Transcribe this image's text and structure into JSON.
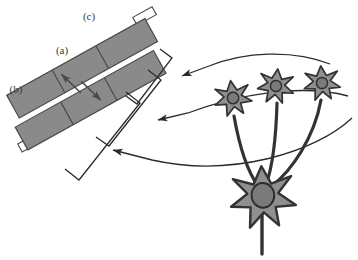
{
  "figure": {
    "background_color": "#ffffff",
    "labels": [
      {
        "id": "a",
        "text": "(a)",
        "x": 62,
        "y": 54,
        "refers_to": "bidirectional-transport-arrows"
      },
      {
        "id": "b",
        "text": "(b)",
        "x": 16,
        "y": 93,
        "refers_to": "lower-myelin-band"
      },
      {
        "id": "c",
        "text": "(c)",
        "x": 89,
        "y": 20,
        "refers_to": "upper-myelin-band"
      }
    ],
    "colors": {
      "band_fill": "#8a8a8a",
      "band_stroke": "#4a4a4a",
      "soma_fill": "#8f8f8f",
      "soma_stroke": "#333333",
      "nucleus_fill": "#7a7a7a",
      "nucleus_stroke": "#2e2e2e",
      "line_stroke": "#2b2b2b",
      "label_color": "#3a3a3a",
      "tab_fill": "#ffffff"
    },
    "bands": {
      "count": 2,
      "description": "Two parallel gray bands oriented diagonally, separated by a thin white cleft",
      "segment_divider_count": 4,
      "end_tabs": 2
    },
    "arrows": {
      "transport": [
        {
          "name": "arrow-up-left",
          "direction": "up-left"
        },
        {
          "name": "arrow-down-right",
          "direction": "down-right"
        }
      ],
      "pointer_count": 3,
      "pointer_description": "Three curved arrows leading from the glial cells to three nested brackets"
    },
    "brackets": {
      "count": 3,
      "names": [
        "bracket-inner",
        "bracket-middle",
        "bracket-outer"
      ]
    },
    "cells": {
      "small_count": 3,
      "large_count": 1,
      "small_name": "glial-cell",
      "large_name": "neuron-soma",
      "axon_count": 3,
      "has_descending_axon": true
    }
  }
}
